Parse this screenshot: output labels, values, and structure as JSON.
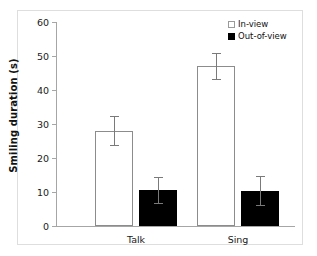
{
  "chart_data": {
    "type": "bar",
    "title": "",
    "subtitle": "",
    "xlabel": "",
    "ylabel": "Smiling duration (s)",
    "categories": [
      "Talk",
      "Sing"
    ],
    "ylim": [
      0,
      60
    ],
    "ytick_values": [
      0,
      10,
      20,
      30,
      40,
      50,
      60
    ],
    "ytick_labels": [
      "0",
      "10",
      "20",
      "30",
      "40",
      "50",
      "60"
    ],
    "grid": false,
    "legend_position": "top-right",
    "series": [
      {
        "name": "In-view",
        "color": "#ffffff",
        "edge_color": "#8c8c8c",
        "values": [
          28.0,
          47.0
        ],
        "errors": [
          4.5,
          4.0
        ]
      },
      {
        "name": "Out-of-view",
        "color": "#000000",
        "edge_color": "#000000",
        "values": [
          10.5,
          10.3
        ],
        "errors": [
          4.0,
          4.5
        ]
      }
    ],
    "annotations": []
  },
  "axis": {
    "y_title": "Smiling duration (s)",
    "ticks": [
      {
        "label": "60",
        "value": 60
      },
      {
        "label": "50",
        "value": 50
      },
      {
        "label": "40",
        "value": 40
      },
      {
        "label": "30",
        "value": 30
      },
      {
        "label": "20",
        "value": 20
      },
      {
        "label": "10",
        "value": 10
      },
      {
        "label": "0",
        "value": 0
      }
    ]
  },
  "categories": [
    {
      "label": "Talk"
    },
    {
      "label": "Sing"
    }
  ],
  "legend": {
    "items": [
      {
        "label": "In-view",
        "swatch": "open-square-swatch"
      },
      {
        "label": "Out-of-view",
        "swatch": "filled-square-swatch"
      }
    ]
  }
}
